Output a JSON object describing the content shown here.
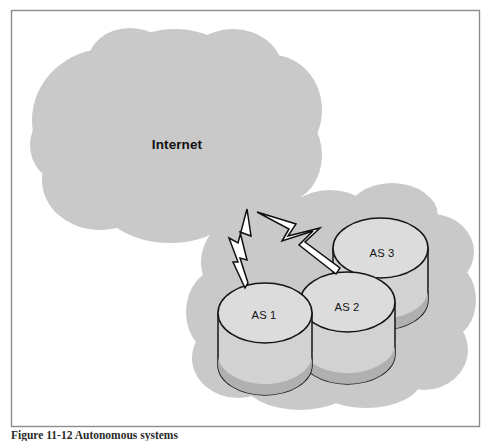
{
  "figure": {
    "domain": "diagram",
    "diagram_type": "network-topology",
    "caption": "Figure 11-12   Autonomous systems",
    "background_color": "#ffffff",
    "border_color": "#8c8c8c"
  },
  "palette": {
    "cloud_fill": "#c9c9c9",
    "cylinder_top": "#dcdcdc",
    "cylinder_body": "#d2d2d2",
    "cylinder_shade": "#aeaeae",
    "outline": "#141414",
    "bolt_fill": "#ffffff",
    "bolt_outline": "#101010",
    "text": "#121212"
  },
  "clouds": [
    {
      "id": "internet-cloud",
      "label": "Internet",
      "label_x": 177,
      "label_y": 149,
      "bounds": {
        "x": 33,
        "y": 28,
        "width": 287,
        "height": 217
      }
    },
    {
      "id": "as-cloud",
      "label": "",
      "bounds": {
        "x": 190,
        "y": 186,
        "width": 282,
        "height": 214
      }
    }
  ],
  "nodes": [
    {
      "id": "as3",
      "label": "AS 3",
      "label_x": 382,
      "label_y": 257,
      "cx": 380.5,
      "cy": 248,
      "rx": 47.5,
      "ry": 30,
      "body_height": 52,
      "z": 1
    },
    {
      "id": "as2",
      "label": "AS 2",
      "label_x": 347,
      "label_y": 311,
      "cx": 347.5,
      "cy": 302,
      "rx": 47.5,
      "ry": 30,
      "body_height": 52,
      "z": 2
    },
    {
      "id": "as1",
      "label": "AS 1",
      "label_x": 264,
      "label_y": 319,
      "cx": 265,
      "cy": 313,
      "rx": 47,
      "ry": 30,
      "body_height": 52,
      "z": 3
    }
  ],
  "links": [
    {
      "id": "link-internet-as1",
      "type": "lightning-bolt",
      "from": "internet-cloud",
      "to": "as1"
    },
    {
      "id": "link-internet-as3",
      "type": "lightning-bolt",
      "from": "internet-cloud",
      "to": "as3"
    }
  ]
}
